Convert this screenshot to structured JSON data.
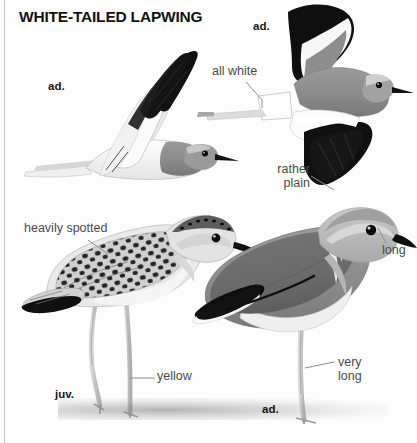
{
  "plate": {
    "title": "WHITE-TAILED LAPWING",
    "species": "White-tailed Lapwing",
    "style": "grayscale field-guide illustration plate"
  },
  "age_labels": [
    {
      "id": "flying-left",
      "text": "ad.",
      "x": 48,
      "y": 80
    },
    {
      "id": "flying-right",
      "text": "ad.",
      "x": 253,
      "y": 20
    },
    {
      "id": "standing-juv",
      "text": "juv.",
      "x": 55,
      "y": 388
    },
    {
      "id": "standing-ad",
      "text": "ad.",
      "x": 262,
      "y": 403
    }
  ],
  "annotations": [
    {
      "id": "all-white",
      "text": "all white",
      "x": 212,
      "y": 64,
      "align": "left"
    },
    {
      "id": "rather-plain",
      "line1": "rather",
      "line2": "plain",
      "x": 258,
      "y": 162,
      "align": "right"
    },
    {
      "id": "heavily-spotted",
      "text": "heavily spotted",
      "x": 24,
      "y": 221,
      "align": "left"
    },
    {
      "id": "long",
      "text": "long",
      "x": 382,
      "y": 243,
      "align": "left"
    },
    {
      "id": "yellow",
      "text": "yellow",
      "x": 157,
      "y": 369,
      "align": "left"
    },
    {
      "id": "very-long",
      "line1": "very",
      "line2": "long",
      "x": 338,
      "y": 355,
      "align": "left"
    }
  ],
  "figures": [
    {
      "id": "flying-left",
      "pose": "flight, underwing visible",
      "age": "adult"
    },
    {
      "id": "flying-right",
      "pose": "flight, upperwing visible",
      "age": "adult"
    },
    {
      "id": "standing-juv",
      "pose": "standing, spotted upperparts",
      "age": "juvenile"
    },
    {
      "id": "standing-ad",
      "pose": "standing, plain upperparts",
      "age": "adult"
    }
  ],
  "colors": {
    "page": "#fdfdfd",
    "ink_black": "#121212",
    "body_gray": "#8d8d8d",
    "wing_dark": "#6f6f6f",
    "pale_gray": "#d9d9d9",
    "white": "#ffffff",
    "leader_line": "#8e8e8e",
    "annotation_text": "#4b4b4b",
    "margin_rule": "#c9c9c9"
  }
}
